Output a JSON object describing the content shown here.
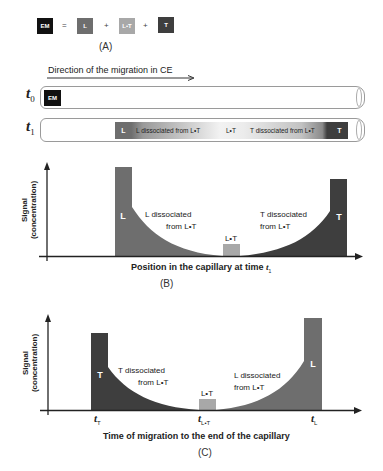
{
  "panel_a": {
    "caption": "(A)",
    "equation": {
      "em": "EM",
      "equals": "=",
      "l": "L",
      "plus1": "+",
      "lt": "L•T",
      "plus2": "+",
      "t": "T"
    },
    "colors": {
      "em": "#111111",
      "l": "#6e6e6e",
      "lt": "#a8a8a8",
      "t": "#3e3e3e"
    }
  },
  "capillary": {
    "direction_label": "Direction of the migration in CE",
    "t0": {
      "label": "t",
      "sub": "0",
      "zone": "EM"
    },
    "t1": {
      "label": "t",
      "sub": "1",
      "zones": {
        "l": "L",
        "l_dissociated": "L dissociated from L•T",
        "lt": "L•T",
        "t_dissociated": "T dissociated from L•T",
        "t": "T"
      }
    }
  },
  "panel_b": {
    "caption": "(B)",
    "ylabel_line1": "Signal",
    "ylabel_line2": "(concentration)",
    "xlabel": "Position in the capillary at time ",
    "xlabel_var": "t",
    "xlabel_sub": "1",
    "peaks": {
      "l": "L",
      "lt": "L•T",
      "t": "T"
    },
    "l_dissociated_line1": "L dissociated",
    "l_dissociated_line2": "from L•T",
    "t_dissociated_line1": "T dissociated",
    "t_dissociated_line2": "from L•T"
  },
  "panel_c": {
    "caption": "(C)",
    "ylabel_line1": "Signal",
    "ylabel_line2": "(concentration)",
    "xlabel": "Time of migration to the end of the capillary",
    "peaks": {
      "t": "T",
      "lt": "L•T",
      "l": "L"
    },
    "t_dissociated_line1": "T dissociated",
    "t_dissociated_line2": "from L•T",
    "l_dissociated_line1": "L dissociated",
    "l_dissociated_line2": "from L•T",
    "ticks": [
      {
        "var": "t",
        "sub": "T"
      },
      {
        "var": "t",
        "sub": "L•T"
      },
      {
        "var": "t",
        "sub": "L"
      }
    ]
  }
}
